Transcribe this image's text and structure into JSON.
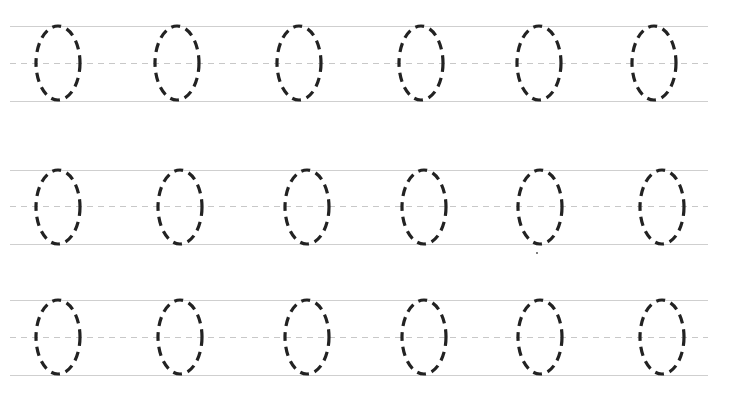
{
  "worksheet": {
    "title": "",
    "glyph": "0",
    "stroke_color": "#222222",
    "guide_color": "#cfcfcf",
    "rows": [
      {
        "top": 26,
        "mid": 63,
        "bottom": 101,
        "ovals": [
          {
            "cx": 58,
            "cy": 63
          },
          {
            "cx": 177,
            "cy": 63
          },
          {
            "cx": 299,
            "cy": 63
          },
          {
            "cx": 421,
            "cy": 63
          },
          {
            "cx": 539,
            "cy": 63
          },
          {
            "cx": 654,
            "cy": 63
          }
        ]
      },
      {
        "top": 170,
        "mid": 206,
        "bottom": 244,
        "ovals": [
          {
            "cx": 58,
            "cy": 207
          },
          {
            "cx": 180,
            "cy": 207
          },
          {
            "cx": 307,
            "cy": 207
          },
          {
            "cx": 424,
            "cy": 207
          },
          {
            "cx": 540,
            "cy": 207
          },
          {
            "cx": 662,
            "cy": 207
          }
        ]
      },
      {
        "top": 300,
        "mid": 337,
        "bottom": 375,
        "ovals": [
          {
            "cx": 58,
            "cy": 337
          },
          {
            "cx": 180,
            "cy": 337
          },
          {
            "cx": 307,
            "cy": 337
          },
          {
            "cx": 424,
            "cy": 337
          },
          {
            "cx": 540,
            "cy": 337
          },
          {
            "cx": 662,
            "cy": 337
          }
        ]
      }
    ],
    "oval_rx": 22,
    "oval_ry": 37,
    "stray_marks": [
      {
        "x": 537,
        "y": 253
      }
    ]
  }
}
